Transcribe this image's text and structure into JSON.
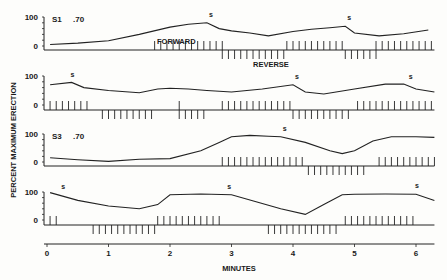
{
  "chart_data": {
    "type": "line",
    "title": "",
    "xlabel": "MINUTES",
    "ylabel": "PERCENT MAXIMUM ERECTION",
    "xlim": [
      0,
      6.3
    ],
    "x_ticks": [
      "0",
      "1",
      "2",
      "3",
      "4",
      "5",
      "6"
    ],
    "grid": false,
    "panels": [
      {
        "name": "S1",
        "label": "S1",
        "value_label": ".70",
        "y_ticks": [
          "100",
          "0"
        ],
        "ylim": [
          0,
          100
        ],
        "x": [
          0.05,
          0.5,
          1.0,
          1.5,
          2.0,
          2.3,
          2.6,
          2.8,
          3.0,
          3.3,
          3.6,
          4.0,
          4.3,
          4.6,
          4.85,
          5.0,
          5.4,
          5.8,
          6.2
        ],
        "values": [
          5,
          10,
          18,
          40,
          65,
          75,
          80,
          60,
          52,
          45,
          35,
          50,
          58,
          63,
          68,
          45,
          35,
          42,
          55
        ],
        "s_markers": [
          2.6,
          4.85
        ],
        "annotations": [
          "FORWARD",
          "REVERSE"
        ],
        "forward_bars": [
          [
            1.75,
            2.85
          ],
          [
            3.9,
            4.85
          ],
          [
            5.35,
            6.3
          ]
        ],
        "reverse_bars": [
          [
            2.85,
            3.9
          ],
          [
            4.85,
            5.35
          ]
        ]
      },
      {
        "name": "S2",
        "label": "",
        "value_label": "",
        "y_ticks": [
          "100",
          "0"
        ],
        "ylim": [
          0,
          100
        ],
        "x": [
          0.05,
          0.4,
          0.6,
          1.0,
          1.5,
          1.8,
          2.0,
          2.3,
          2.6,
          3.0,
          3.5,
          4.0,
          4.2,
          4.5,
          5.0,
          5.5,
          5.8,
          6.0,
          6.3
        ],
        "values": [
          70,
          78,
          60,
          50,
          42,
          55,
          58,
          55,
          50,
          45,
          55,
          70,
          45,
          38,
          55,
          72,
          72,
          55,
          45
        ],
        "s_markers": [
          0.35,
          4.0,
          5.85
        ],
        "forward_bars": [
          [
            0.05,
            0.7
          ],
          [
            2.15,
            2.15
          ],
          [
            2.85,
            4.0
          ],
          [
            5.05,
            6.3
          ]
        ],
        "reverse_bars": [
          [
            0.9,
            1.7
          ],
          [
            2.15,
            2.6
          ],
          [
            4.0,
            4.9
          ]
        ]
      },
      {
        "name": "S3",
        "label": "S3",
        "value_label": ".70",
        "y_ticks": [
          "100",
          "0"
        ],
        "ylim": [
          0,
          100
        ],
        "x": [
          0.05,
          0.5,
          1.0,
          1.5,
          2.0,
          2.5,
          2.8,
          3.0,
          3.3,
          3.6,
          3.8,
          4.2,
          4.6,
          4.8,
          5.0,
          5.3,
          5.6,
          6.0,
          6.3
        ],
        "values": [
          15,
          8,
          2,
          10,
          12,
          40,
          70,
          90,
          95,
          92,
          90,
          70,
          40,
          30,
          40,
          75,
          90,
          90,
          88
        ],
        "s_markers": [
          3.8
        ],
        "forward_bars": [
          [
            2.85,
            4.15
          ],
          [
            5.4,
            6.3
          ]
        ],
        "reverse_bars": [
          [
            4.25,
            5.15
          ]
        ]
      },
      {
        "name": "S4",
        "label": "",
        "value_label": "",
        "y_ticks": [
          "100",
          "0"
        ],
        "ylim": [
          0,
          100
        ],
        "x": [
          0.05,
          0.5,
          1.0,
          1.5,
          1.8,
          2.0,
          2.5,
          3.0,
          3.4,
          3.8,
          4.2,
          4.5,
          4.8,
          5.0,
          5.5,
          6.0,
          6.3
        ],
        "values": [
          98,
          70,
          50,
          40,
          55,
          90,
          93,
          90,
          65,
          40,
          20,
          55,
          90,
          92,
          93,
          92,
          70
        ],
        "s_markers": [
          0.2,
          2.9,
          5.95
        ],
        "forward_bars": [
          [
            0.05,
            0.15
          ],
          [
            1.8,
            2.8
          ],
          [
            4.85,
            5.95
          ]
        ],
        "reverse_bars": [
          [
            0.75,
            1.75
          ],
          [
            3.6,
            4.7
          ]
        ]
      }
    ]
  },
  "labels": {
    "y_axis": "PERCENT MAXIMUM ERECTION",
    "x_axis": "MINUTES",
    "forward": "FORWARD",
    "reverse": "REVERSE",
    "panel1_id": "S1",
    "panel1_val": ".70",
    "panel3_id": "S3",
    "panel3_val": ".70",
    "tick100": "100",
    "tick0": "0",
    "s": "s",
    "x_ticks": [
      "0",
      "1",
      "2",
      "3",
      "4",
      "5",
      "6"
    ]
  }
}
